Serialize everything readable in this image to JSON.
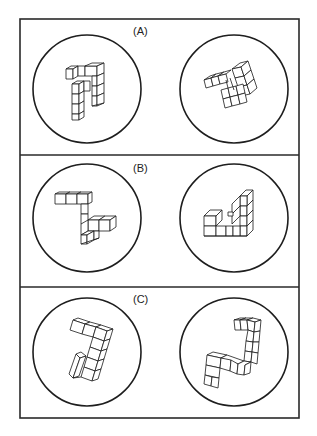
{
  "figure": {
    "type": "mental-rotation-test",
    "frame_color": "#2a2a2a",
    "background": "#ffffff",
    "panels": [
      {
        "id": "A",
        "label": "(A)",
        "stimuli": [
          {
            "position": "left",
            "content": "cube-assembly-icon",
            "description": "upright L/hook-shaped block figure"
          },
          {
            "position": "right",
            "content": "cube-assembly-icon",
            "description": "rotated block figure, tilted view"
          }
        ]
      },
      {
        "id": "B",
        "label": "(B)",
        "stimuli": [
          {
            "position": "left",
            "content": "cube-assembly-icon",
            "description": "Z-shaped block figure"
          },
          {
            "position": "right",
            "content": "cube-assembly-icon",
            "description": "triangular-corner block figure"
          }
        ]
      },
      {
        "id": "C",
        "label": "(C)",
        "stimuli": [
          {
            "position": "left",
            "content": "cube-assembly-icon",
            "description": "tilted S-shaped block figure"
          },
          {
            "position": "right",
            "content": "cube-assembly-icon",
            "description": "S-shaped block figure, different orientation"
          }
        ]
      }
    ]
  }
}
